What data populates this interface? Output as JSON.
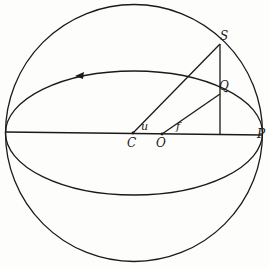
{
  "diagram": {
    "type": "orbital geometry — eccentric anomaly construction",
    "labels": {
      "S": "S",
      "Q": "Q",
      "P": "P",
      "C": "C",
      "O": "O",
      "u": "u",
      "f": "f"
    },
    "colors": {
      "stroke": "#1a1a1a",
      "background": "#fdfdfb"
    }
  }
}
